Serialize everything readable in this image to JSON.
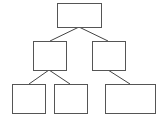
{
  "diagram": {
    "type": "tree",
    "stroke_color": "#555555",
    "nodes": [
      {
        "id": "root",
        "label": "",
        "x": 57,
        "y": 3,
        "w": 44,
        "h": 24
      },
      {
        "id": "left-child",
        "label": "",
        "x": 33,
        "y": 41,
        "w": 33,
        "h": 29
      },
      {
        "id": "right-child",
        "label": "",
        "x": 92,
        "y": 41,
        "w": 33,
        "h": 29
      },
      {
        "id": "left-left-leaf",
        "label": "",
        "x": 12,
        "y": 84,
        "w": 33,
        "h": 29
      },
      {
        "id": "left-right-leaf",
        "label": "",
        "x": 54,
        "y": 84,
        "w": 33,
        "h": 29
      },
      {
        "id": "right-leaf",
        "label": "",
        "x": 105,
        "y": 84,
        "w": 50,
        "h": 29
      }
    ],
    "edges": [
      {
        "from": "root",
        "to": "left-child"
      },
      {
        "from": "root",
        "to": "right-child"
      },
      {
        "from": "left-child",
        "to": "left-left-leaf"
      },
      {
        "from": "left-child",
        "to": "left-right-leaf"
      },
      {
        "from": "right-child",
        "to": "right-leaf"
      }
    ]
  }
}
